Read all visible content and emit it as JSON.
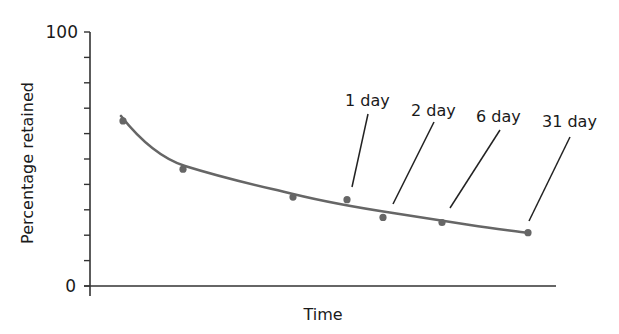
{
  "chart_data": {
    "type": "scatter",
    "title": "",
    "xlabel": "Time",
    "ylabel": "Percentage retained",
    "ylim": [
      0,
      100
    ],
    "y_ticks": [
      0,
      10,
      20,
      30,
      40,
      50,
      60,
      70,
      80,
      90,
      100
    ],
    "y_tick_labels": [
      {
        "value": 0,
        "label": "0"
      },
      {
        "value": 100,
        "label": "100"
      }
    ],
    "x_ticks": [],
    "grid": false,
    "legend": null,
    "series": [
      {
        "name": "Observed retention",
        "kind": "points",
        "color": "#666666",
        "x": [
          1,
          2,
          3,
          4,
          5,
          6,
          7
        ],
        "values": [
          65,
          46,
          35,
          34,
          27,
          25,
          21
        ]
      },
      {
        "name": "Fitted forgetting curve",
        "kind": "line",
        "color": "#666666",
        "x": [
          0.95,
          2,
          3,
          4,
          5,
          6,
          7
        ],
        "values": [
          67,
          47,
          38,
          33,
          29,
          25.5,
          22
        ]
      }
    ],
    "annotations": [
      {
        "label": "1 day",
        "points_to_x": 4
      },
      {
        "label": "2 day",
        "points_to_x": 4.65
      },
      {
        "label": "6 day",
        "points_to_x": 5.8
      },
      {
        "label": "31 day",
        "points_to_x": 7
      }
    ]
  },
  "labels": {
    "y_max": "100",
    "y_min": "0",
    "x_title": "Time",
    "y_title": "Percentage retained",
    "ann_1": "1 day",
    "ann_2": "2 day",
    "ann_3": "6 day",
    "ann_4": "31 day"
  },
  "colors": {
    "curve": "#666666",
    "points": "#666666",
    "axis": "#333333",
    "text": "#1a1a1a"
  }
}
